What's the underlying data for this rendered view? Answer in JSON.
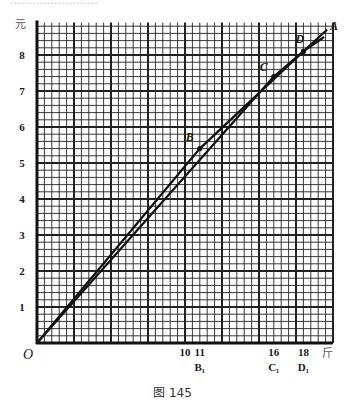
{
  "caption": "图 145",
  "cropped_top_text": "……………………",
  "chart_data": {
    "type": "line",
    "title": "",
    "caption": "图 145",
    "xlabel": "斤",
    "ylabel": "元",
    "xlim": [
      0,
      20
    ],
    "ylim": [
      0,
      8.9
    ],
    "grid": true,
    "grid_major_x_step": 2.5,
    "grid_minor_x_step": 0.5,
    "grid_major_y_step": 1,
    "grid_minor_y_step": 0.2,
    "x_ticks": [
      {
        "value": 10,
        "label": "10",
        "sub": ""
      },
      {
        "value": 11,
        "label": "11",
        "sub": "B₁"
      },
      {
        "value": 16,
        "label": "16",
        "sub": "C₁"
      },
      {
        "value": 18,
        "label": "18",
        "sub": "D₁"
      }
    ],
    "y_ticks": [
      {
        "value": 1,
        "label": "1"
      },
      {
        "value": 2,
        "label": "2"
      },
      {
        "value": 3,
        "label": "3"
      },
      {
        "value": 4,
        "label": "4"
      },
      {
        "value": 5,
        "label": "5"
      },
      {
        "value": 6,
        "label": "6"
      },
      {
        "value": 7,
        "label": "7"
      },
      {
        "value": 8,
        "label": "8"
      }
    ],
    "origin_label": "O",
    "series": [
      {
        "name": "OBDA",
        "points": [
          [
            0,
            0
          ],
          [
            11,
            5.4
          ],
          [
            18,
            8.1
          ],
          [
            19.6,
            8.7
          ]
        ]
      },
      {
        "name": "OCDA",
        "points": [
          [
            0,
            0
          ],
          [
            16,
            7.4
          ],
          [
            18,
            8.1
          ],
          [
            19.4,
            8.5
          ]
        ]
      }
    ],
    "annotations": [
      {
        "label": "B",
        "x": 11,
        "y": 5.4
      },
      {
        "label": "C",
        "x": 16,
        "y": 7.4
      },
      {
        "label": "D",
        "x": 18,
        "y": 8.1
      },
      {
        "label": "A",
        "x": 19.8,
        "y": 8.8
      }
    ]
  }
}
